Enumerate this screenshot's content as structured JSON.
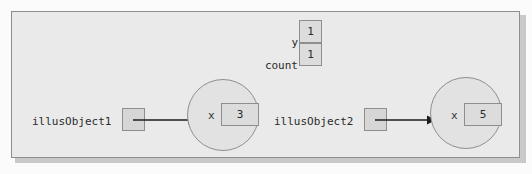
{
  "diagram": {
    "type": "object-reference-memory-diagram",
    "colors": {
      "frame_border": "#8e8e8e",
      "frame_background": "#eaeaea",
      "box_border": "#8e8e8e",
      "box_fill": "#dcdcdc",
      "ref_box_fill": "#d6d6d6",
      "circle_fill": "#e2e2e2",
      "text": "#2a2a2a",
      "shadow": "#c9c9c9"
    },
    "static_fields": [
      {
        "label": "y",
        "value": "1"
      },
      {
        "label": "count",
        "value": "1"
      }
    ],
    "objects": [
      {
        "reference_label": "illusObject1",
        "instance_variable": "x",
        "value": "3"
      },
      {
        "reference_label": "illusObject2",
        "instance_variable": "x",
        "value": "5"
      }
    ],
    "arrows": [
      {
        "from": "illusObject1",
        "to": "object-1",
        "glyph": "arrow-right"
      },
      {
        "from": "illusObject2",
        "to": "object-2",
        "glyph": "arrow-right"
      }
    ]
  }
}
